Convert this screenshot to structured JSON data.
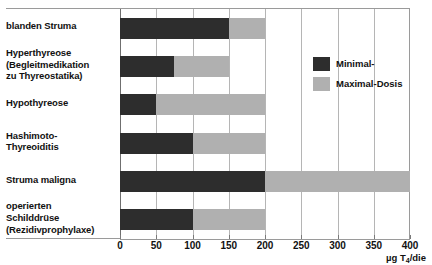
{
  "chart_data": {
    "type": "bar",
    "orientation": "horizontal",
    "stacked": true,
    "title": "",
    "xlabel": "µg T4/die",
    "ylabel": "",
    "xlim": [
      0,
      400
    ],
    "xticks": [
      0,
      50,
      100,
      150,
      200,
      250,
      300,
      350,
      400
    ],
    "xtick_labels": [
      "0",
      "50",
      "100",
      "150",
      "200",
      "250",
      "300",
      "350",
      "400"
    ],
    "grid": true,
    "grid_axis": "x",
    "legend_position": "upper-right-inside",
    "categories": [
      "blanden Struma",
      "Hyperthyreose (Begleitmedikation zu Thyreostatika)",
      "Hypothyreose",
      "Hashimoto-Thyreoiditis",
      "Struma maligna",
      "operierten Schilddrüse (Rezidivprophylaxe)"
    ],
    "series": [
      {
        "name": "Minimal-",
        "color": "#2d2d2d",
        "values": [
          150,
          75,
          50,
          100,
          200,
          100
        ]
      },
      {
        "name": "Maximal-Dosis",
        "color": "#b0b0b0",
        "values": [
          200,
          150,
          200,
          200,
          400,
          200
        ]
      }
    ]
  },
  "axis": {
    "x_title_main": "µg T",
    "x_title_sub": "4",
    "x_title_tail": "/die"
  },
  "legend": {
    "items": [
      {
        "label": "Minimal-",
        "color": "#2d2d2d"
      },
      {
        "label": "Maximal-Dosis",
        "color": "#b0b0b0"
      }
    ]
  },
  "categories_display": [
    {
      "lines": [
        "blanden Struma"
      ]
    },
    {
      "lines": [
        "Hyperthyreose",
        "(Begleitmedikation",
        "zu Thyreostatika)"
      ]
    },
    {
      "lines": [
        "Hypothyreose"
      ]
    },
    {
      "lines": [
        "Hashimoto-",
        "Thyreoiditis"
      ]
    },
    {
      "lines": [
        "Struma maligna"
      ]
    },
    {
      "lines": [
        "operierten",
        "Schilddrüse",
        "(Rezidivprophylaxe)"
      ]
    }
  ]
}
